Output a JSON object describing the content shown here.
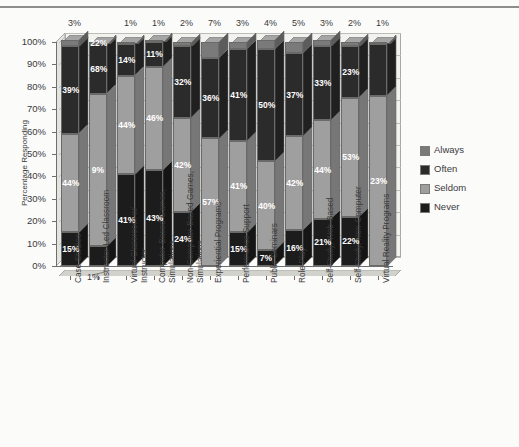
{
  "chart_data": {
    "type": "bar",
    "subtype": "stacked-percentage-column-3d",
    "title": "",
    "xlabel": "",
    "ylabel": "Percentage Responding",
    "ylim": [
      0,
      100
    ],
    "ytick_labels": [
      "0%",
      "10%",
      "20%",
      "30%",
      "40%",
      "50%",
      "60%",
      "70%",
      "80%",
      "90%",
      "100%"
    ],
    "grid": true,
    "legend_position": "right",
    "stack_order_bottom_to_top": [
      "Never",
      "Seldom",
      "Often",
      "Always"
    ],
    "categories": [
      "Case Studies",
      "Instructor-Led Classroom",
      "Virtual Classroom w/\nInstructor",
      "Computer-Based Games,\nSimulations",
      "Non-Computer-Based Games,\nSimulations",
      "Experiential Programs",
      "Performance Support",
      "Public Seminars",
      "Role Play",
      "Self-Study, Web-Based",
      "Self-Study, Non-Computer",
      "Virtual Reality Programs"
    ],
    "series": [
      {
        "name": "Always",
        "values": [
          3,
          1,
          1,
          1,
          2,
          7,
          3,
          4,
          5,
          3,
          2,
          1
        ]
      },
      {
        "name": "Often",
        "values": [
          39,
          22,
          14,
          11,
          32,
          36,
          41,
          50,
          37,
          33,
          23,
          23
        ]
      },
      {
        "name": "Seldom",
        "values": [
          44,
          68,
          44,
          46,
          42,
          57,
          41,
          40,
          42,
          44,
          53,
          76
        ]
      },
      {
        "name": "Never",
        "values": [
          15,
          9,
          41,
          43,
          24,
          0,
          15,
          7,
          16,
          21,
          22,
          0
        ]
      }
    ],
    "top_annotations": [
      "3%",
      "",
      "1%",
      "1%",
      "2%",
      "7%",
      "3%",
      "4%",
      "5%",
      "3%",
      "2%",
      "1%"
    ],
    "bottom_annotation": {
      "text": "1%",
      "category_index": 1
    },
    "colors": {
      "always": "#7a7a7a",
      "often": "#2b2b2b",
      "seldom": "#9f9f9f",
      "never": "#1c1c1c",
      "plot_background": "#f2f2ef",
      "page_background": "#fbfbfa",
      "grid": "#b9b9b6",
      "text": "#3a3a3a"
    }
  },
  "legend": {
    "items": [
      {
        "label": "Always",
        "color": "#7a7a7a"
      },
      {
        "label": "Often",
        "color": "#2b2b2b"
      },
      {
        "label": "Seldom",
        "color": "#9f9f9f"
      },
      {
        "label": "Never",
        "color": "#1c1c1c"
      }
    ]
  },
  "segment_labels": {
    "bar0": {
      "never": "15%",
      "seldom": "44%",
      "often": "39%",
      "always": ""
    },
    "bar1": {
      "never": "",
      "seldom": "9%",
      "often": "68%",
      "always": "22%"
    },
    "bar2": {
      "never": "41%",
      "seldom": "44%",
      "often": "14%",
      "always": ""
    },
    "bar3": {
      "never": "43%",
      "seldom": "46%",
      "often": "11%",
      "always": ""
    },
    "bar4": {
      "never": "24%",
      "seldom": "42%",
      "often": "32%",
      "always": ""
    },
    "bar5": {
      "never": "",
      "seldom": "57%",
      "often": "36%",
      "always": ""
    },
    "bar6": {
      "never": "15%",
      "seldom": "41%",
      "often": "41%",
      "always": ""
    },
    "bar7": {
      "never": "7%",
      "seldom": "40%",
      "often": "50%",
      "always": ""
    },
    "bar8": {
      "never": "16%",
      "seldom": "42%",
      "often": "37%",
      "always": ""
    },
    "bar9": {
      "never": "21%",
      "seldom": "44%",
      "often": "33%",
      "always": ""
    },
    "bar10": {
      "never": "22%",
      "seldom": "53%",
      "often": "23%",
      "always": ""
    },
    "bar11": {
      "never": "76%",
      "seldom": "23%",
      "often": "",
      "always": ""
    }
  }
}
